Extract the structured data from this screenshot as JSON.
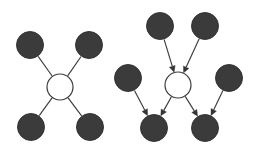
{
  "figure": {
    "background_color": "#ffffff",
    "width": 256,
    "height": 150
  },
  "style": {
    "node_fill_color": "#3b3b3b",
    "node_stroke_color": "#2e2e2e",
    "hub_fill_color": "#ffffff",
    "hub_stroke_color": "#3c3c3c",
    "edge_color": "#3c3c3c",
    "arrow_color": "#343434",
    "node_radius": 13.5,
    "hub_radius": 13,
    "edge_width": 1.15
  },
  "diagrams": [
    {
      "name": "undirected-star-graph",
      "directed": false,
      "hub": {
        "id": "L-hub",
        "cx": 60,
        "cy": 87,
        "r": 13,
        "type": "hollow"
      },
      "nodes": [
        {
          "id": "L-n1",
          "label": "top-left",
          "cx": 30,
          "cy": 45,
          "r": 13.5,
          "type": "filled"
        },
        {
          "id": "L-n2",
          "label": "top-right",
          "cx": 89,
          "cy": 45,
          "r": 13.5,
          "type": "filled"
        },
        {
          "id": "L-n3",
          "label": "bottom-left",
          "cx": 31,
          "cy": 127,
          "r": 13.5,
          "type": "filled"
        },
        {
          "id": "L-n4",
          "label": "bottom-right",
          "cx": 90,
          "cy": 127,
          "r": 13.5,
          "type": "filled"
        }
      ],
      "edges": [
        {
          "id": "L-e1",
          "from": "L-n1",
          "to": "L-hub",
          "arrow": false
        },
        {
          "id": "L-e2",
          "from": "L-n2",
          "to": "L-hub",
          "arrow": false
        },
        {
          "id": "L-e3",
          "from": "L-hub",
          "to": "L-n3",
          "arrow": false
        },
        {
          "id": "L-e4",
          "from": "L-hub",
          "to": "L-n4",
          "arrow": false
        }
      ]
    },
    {
      "name": "directed-star-graph",
      "directed": true,
      "hub": {
        "id": "R-hub",
        "cx": 178,
        "cy": 85,
        "r": 13,
        "type": "hollow"
      },
      "nodes": [
        {
          "id": "R-n1",
          "label": "top-left-source",
          "cx": 160,
          "cy": 26,
          "r": 13.5,
          "type": "filled"
        },
        {
          "id": "R-n2",
          "label": "top-right-source",
          "cx": 205,
          "cy": 26,
          "r": 13.5,
          "type": "filled"
        },
        {
          "id": "R-n3",
          "label": "mid-left-source",
          "cx": 128,
          "cy": 78,
          "r": 13.5,
          "type": "filled"
        },
        {
          "id": "R-n4",
          "label": "mid-right-source",
          "cx": 229,
          "cy": 78,
          "r": 13.5,
          "type": "filled"
        },
        {
          "id": "R-n5",
          "label": "bottom-left-target",
          "cx": 154,
          "cy": 128,
          "r": 13.5,
          "type": "filled"
        },
        {
          "id": "R-n6",
          "label": "bottom-right-target",
          "cx": 205,
          "cy": 128,
          "r": 13.5,
          "type": "filled"
        }
      ],
      "edges": [
        {
          "id": "R-e1",
          "from": "R-n1",
          "to": "R-hub",
          "arrow": true
        },
        {
          "id": "R-e2",
          "from": "R-n2",
          "to": "R-hub",
          "arrow": true
        },
        {
          "id": "R-e3",
          "from": "R-n3",
          "to": "R-n5",
          "arrow": true
        },
        {
          "id": "R-e4",
          "from": "R-hub",
          "to": "R-n5",
          "arrow": true
        },
        {
          "id": "R-e5",
          "from": "R-hub",
          "to": "R-n6",
          "arrow": true
        },
        {
          "id": "R-e6",
          "from": "R-n4",
          "to": "R-n6",
          "arrow": true
        }
      ]
    }
  ]
}
